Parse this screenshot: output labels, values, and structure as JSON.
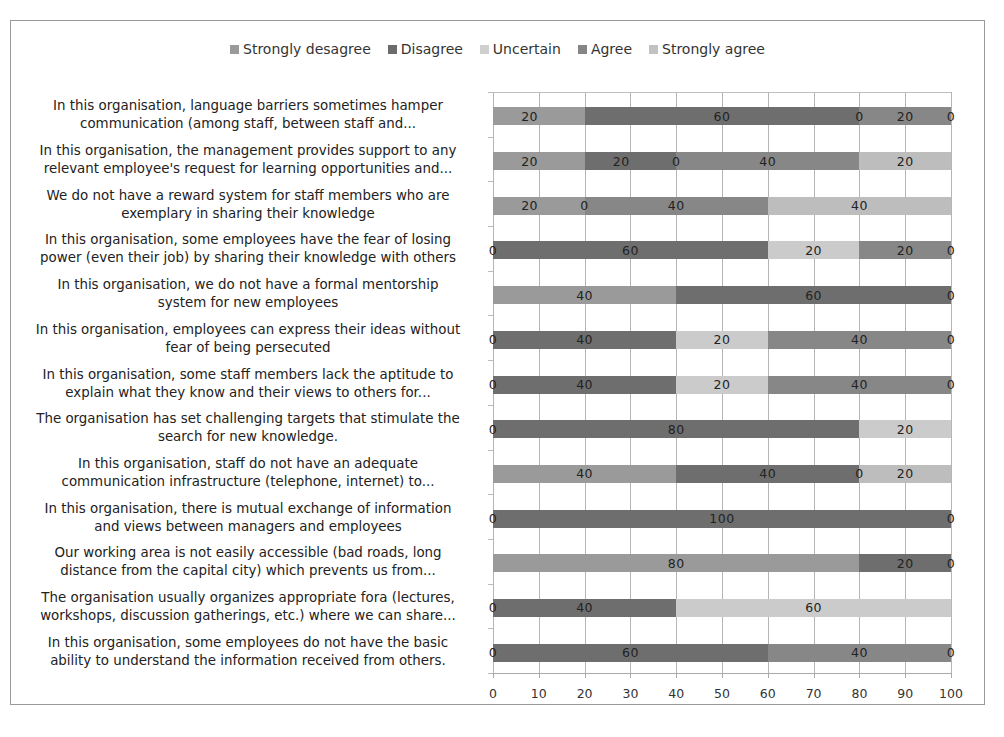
{
  "chart_data": {
    "type": "bar",
    "orientation": "horizontal",
    "stacked": true,
    "title": "",
    "xlabel": "",
    "ylabel": "",
    "xlim": [
      0,
      100
    ],
    "xticks": [
      0,
      10,
      20,
      30,
      40,
      50,
      60,
      70,
      80,
      90,
      100
    ],
    "grid": true,
    "legend_position": "top",
    "categories": [
      [
        "In this organisation, language barriers sometimes hamper",
        "communication (among staff, between staff and..."
      ],
      [
        "In this organisation, the management provides support to any",
        "relevant employee's request for learning opportunities and..."
      ],
      [
        "We do not have a reward system for staff members who are",
        "exemplary in sharing their knowledge"
      ],
      [
        "In this organisation, some employees have the fear of losing",
        "power (even their job) by sharing their knowledge with others"
      ],
      [
        "In this organisation, we do not have a formal mentorship",
        "system for new employees"
      ],
      [
        "In this organisation, employees can express their ideas without",
        "fear of being persecuted"
      ],
      [
        "In this organisation, some staff members lack the aptitude to",
        "explain what they know and their views to others for..."
      ],
      [
        "The organisation has set challenging targets that stimulate the",
        "search for new knowledge."
      ],
      [
        "In this organisation, staff do not have an adequate",
        "communication infrastructure (telephone, internet) to..."
      ],
      [
        "In this organisation, there is mutual exchange of information",
        "and views between managers and employees"
      ],
      [
        "Our working area is not easily accessible (bad roads, long",
        "distance from the capital city) which prevents us from..."
      ],
      [
        "The organisation usually organizes appropriate fora (lectures,",
        "workshops, discussion gatherings, etc.) where we can share..."
      ],
      [
        "In this organisation, some employees do not have the basic",
        "ability to understand the information received from others."
      ]
    ],
    "series": [
      {
        "name": "Strongly desagree",
        "color": "#9a9a9a",
        "values": [
          20,
          20,
          20,
          0,
          40,
          0,
          0,
          0,
          40,
          0,
          80,
          0,
          0
        ],
        "labels": [
          "20",
          "20",
          "20",
          "0",
          "40",
          "0",
          "0",
          "0",
          "40",
          "0",
          "80",
          "0",
          "0"
        ]
      },
      {
        "name": "Disagree",
        "color": "#6e6e6e",
        "values": [
          60,
          20,
          0,
          60,
          60,
          40,
          40,
          80,
          40,
          100,
          20,
          40,
          60
        ],
        "labels": [
          "60",
          "20",
          "0",
          "60",
          "60",
          "40",
          "40",
          "80",
          "40",
          "100",
          "20",
          "40",
          "60"
        ]
      },
      {
        "name": "Uncertain",
        "color": "#c8c8c8",
        "values": [
          0,
          0,
          40,
          20,
          0,
          20,
          20,
          20,
          0,
          0,
          0,
          60,
          0
        ],
        "labels": [
          "0",
          "0",
          "40",
          "20",
          "",
          "20",
          "20",
          "20",
          "0",
          "",
          "",
          "60",
          ""
        ]
      },
      {
        "name": "Agree",
        "color": "#8a8a8a",
        "values": [
          20,
          40,
          0,
          20,
          0,
          40,
          40,
          0,
          0,
          0,
          0,
          0,
          40
        ],
        "labels": [
          "20",
          "40",
          "",
          "20",
          "",
          "40",
          "40",
          "",
          "",
          "",
          "",
          "",
          "40"
        ]
      },
      {
        "name": "Strongly agree",
        "color": "#bcbcbc",
        "values": [
          0,
          20,
          0,
          0,
          0,
          0,
          0,
          0,
          20,
          0,
          0,
          0,
          0
        ],
        "labels": [
          "0",
          "20",
          "",
          "0",
          "0",
          "0",
          "0",
          "",
          "20",
          "0",
          "0",
          "",
          ""
        ]
      }
    ]
  },
  "legend": [
    {
      "label": "Strongly desagree",
      "color": "#9a9a9a"
    },
    {
      "label": "Disagree",
      "color": "#6b6b6b"
    },
    {
      "label": "Uncertain",
      "color": "#cfcfcf"
    },
    {
      "label": "Agree",
      "color": "#858585"
    },
    {
      "label": "Strongly agree",
      "color": "#c2c2c2"
    }
  ],
  "x_axis": {
    "tick_labels": [
      "0",
      "10",
      "20",
      "30",
      "40",
      "50",
      "60",
      "70",
      "80",
      "90",
      "100"
    ]
  },
  "rows": [
    {
      "line1": "In this organisation, language barriers sometimes hamper",
      "line2": "communication (among staff, between staff and...",
      "segments": [
        {
          "series": 0,
          "start": 0,
          "width": 20,
          "label": "20",
          "labelPos": 8
        },
        {
          "series": 1,
          "start": 20,
          "width": 60,
          "label": "60",
          "labelPos": 50
        },
        {
          "series": 3,
          "start": 80,
          "width": 20,
          "label": "20",
          "labelPos": 90
        }
      ],
      "extraLabels": [
        {
          "label": "0",
          "pos": 80
        },
        {
          "label": "0",
          "pos": 100
        }
      ]
    },
    {
      "line1": "In this organisation, the management provides support to any",
      "line2": "relevant employee's request for learning opportunities and...",
      "segments": [
        {
          "series": 0,
          "start": 0,
          "width": 20,
          "label": "20",
          "labelPos": 8
        },
        {
          "series": 1,
          "start": 20,
          "width": 20,
          "label": "20",
          "labelPos": 28
        },
        {
          "series": 3,
          "start": 40,
          "width": 40,
          "label": "40",
          "labelPos": 60
        },
        {
          "series": 4,
          "start": 80,
          "width": 20,
          "label": "20",
          "labelPos": 90
        }
      ],
      "extraLabels": [
        {
          "label": "0",
          "pos": 40
        }
      ]
    },
    {
      "line1": "We do not have a reward system for staff members who are",
      "line2": "exemplary in sharing their knowledge",
      "segments": [
        {
          "series": 0,
          "start": 0,
          "width": 20,
          "label": "20",
          "labelPos": 8
        },
        {
          "series": 3,
          "start": 20,
          "width": 40,
          "label": "40",
          "labelPos": 40
        },
        {
          "series": 4,
          "start": 60,
          "width": 40,
          "label": "40",
          "labelPos": 80
        }
      ],
      "extraLabels": [
        {
          "label": "0",
          "pos": 20
        }
      ]
    },
    {
      "line1": "In this organisation, some employees have the fear of losing",
      "line2": "power (even their job) by sharing their knowledge with others",
      "segments": [
        {
          "series": 1,
          "start": 0,
          "width": 60,
          "label": "60",
          "labelPos": 30
        },
        {
          "series": 2,
          "start": 60,
          "width": 20,
          "label": "20",
          "labelPos": 70
        },
        {
          "series": 3,
          "start": 80,
          "width": 20,
          "label": "20",
          "labelPos": 90
        }
      ],
      "extraLabels": [
        {
          "label": "0",
          "pos": 0
        },
        {
          "label": "0",
          "pos": 100
        }
      ]
    },
    {
      "line1": "In this organisation, we do not have a formal mentorship",
      "line2": "system for new employees",
      "segments": [
        {
          "series": 0,
          "start": 0,
          "width": 40,
          "label": "40",
          "labelPos": 20
        },
        {
          "series": 1,
          "start": 40,
          "width": 60,
          "label": "60",
          "labelPos": 70
        }
      ],
      "extraLabels": [
        {
          "label": "0",
          "pos": 100
        }
      ]
    },
    {
      "line1": "In this organisation, employees can express their ideas without",
      "line2": "fear of being persecuted",
      "segments": [
        {
          "series": 1,
          "start": 0,
          "width": 40,
          "label": "40",
          "labelPos": 20
        },
        {
          "series": 2,
          "start": 40,
          "width": 20,
          "label": "20",
          "labelPos": 50
        },
        {
          "series": 3,
          "start": 60,
          "width": 40,
          "label": "40",
          "labelPos": 80
        }
      ],
      "extraLabels": [
        {
          "label": "0",
          "pos": 0
        },
        {
          "label": "0",
          "pos": 100
        }
      ]
    },
    {
      "line1": "In this organisation, some staff members lack the aptitude to",
      "line2": "explain what they know and their views to others for...",
      "segments": [
        {
          "series": 1,
          "start": 0,
          "width": 40,
          "label": "40",
          "labelPos": 20
        },
        {
          "series": 2,
          "start": 40,
          "width": 20,
          "label": "20",
          "labelPos": 50
        },
        {
          "series": 3,
          "start": 60,
          "width": 40,
          "label": "40",
          "labelPos": 80
        }
      ],
      "extraLabels": [
        {
          "label": "0",
          "pos": 0
        },
        {
          "label": "0",
          "pos": 100
        }
      ]
    },
    {
      "line1": "The organisation has set challenging targets that stimulate the",
      "line2": "search for new knowledge.",
      "segments": [
        {
          "series": 1,
          "start": 0,
          "width": 80,
          "label": "80",
          "labelPos": 40
        },
        {
          "series": 2,
          "start": 80,
          "width": 20,
          "label": "20",
          "labelPos": 90
        }
      ],
      "extraLabels": [
        {
          "label": "0",
          "pos": 0
        }
      ]
    },
    {
      "line1": "In this organisation, staff do not have an adequate",
      "line2": "communication infrastructure (telephone, internet) to...",
      "segments": [
        {
          "series": 0,
          "start": 0,
          "width": 40,
          "label": "40",
          "labelPos": 20
        },
        {
          "series": 1,
          "start": 40,
          "width": 40,
          "label": "40",
          "labelPos": 60
        },
        {
          "series": 4,
          "start": 80,
          "width": 20,
          "label": "20",
          "labelPos": 90
        }
      ],
      "extraLabels": [
        {
          "label": "0",
          "pos": 80
        }
      ]
    },
    {
      "line1": "In this organisation, there is mutual exchange of information",
      "line2": "and views between managers and employees",
      "segments": [
        {
          "series": 1,
          "start": 0,
          "width": 100,
          "label": "100",
          "labelPos": 50
        }
      ],
      "extraLabels": [
        {
          "label": "0",
          "pos": 0
        },
        {
          "label": "0",
          "pos": 100
        }
      ]
    },
    {
      "line1": "Our working area is not easily accessible (bad roads, long",
      "line2": "distance from the capital city) which prevents us from...",
      "segments": [
        {
          "series": 0,
          "start": 0,
          "width": 80,
          "label": "80",
          "labelPos": 40
        },
        {
          "series": 1,
          "start": 80,
          "width": 20,
          "label": "20",
          "labelPos": 90
        }
      ],
      "extraLabels": [
        {
          "label": "0",
          "pos": 100
        }
      ]
    },
    {
      "line1": "The organisation usually organizes appropriate fora (lectures,",
      "line2": "workshops, discussion gatherings, etc.) where we can share...",
      "segments": [
        {
          "series": 1,
          "start": 0,
          "width": 40,
          "label": "40",
          "labelPos": 20
        },
        {
          "series": 2,
          "start": 40,
          "width": 60,
          "label": "60",
          "labelPos": 70
        }
      ],
      "extraLabels": [
        {
          "label": "0",
          "pos": 0
        }
      ]
    },
    {
      "line1": "In this organisation, some employees do not have the basic",
      "line2": "ability to understand the information received from others.",
      "segments": [
        {
          "series": 1,
          "start": 0,
          "width": 60,
          "label": "60",
          "labelPos": 30
        },
        {
          "series": 3,
          "start": 60,
          "width": 40,
          "label": "40",
          "labelPos": 80
        }
      ],
      "extraLabels": [
        {
          "label": "0",
          "pos": 0
        },
        {
          "label": "0",
          "pos": 100
        }
      ]
    }
  ],
  "series_colors": [
    "#9a9a9a",
    "#6e6e6e",
    "#cbcbcb",
    "#878787",
    "#bdbdbd"
  ]
}
